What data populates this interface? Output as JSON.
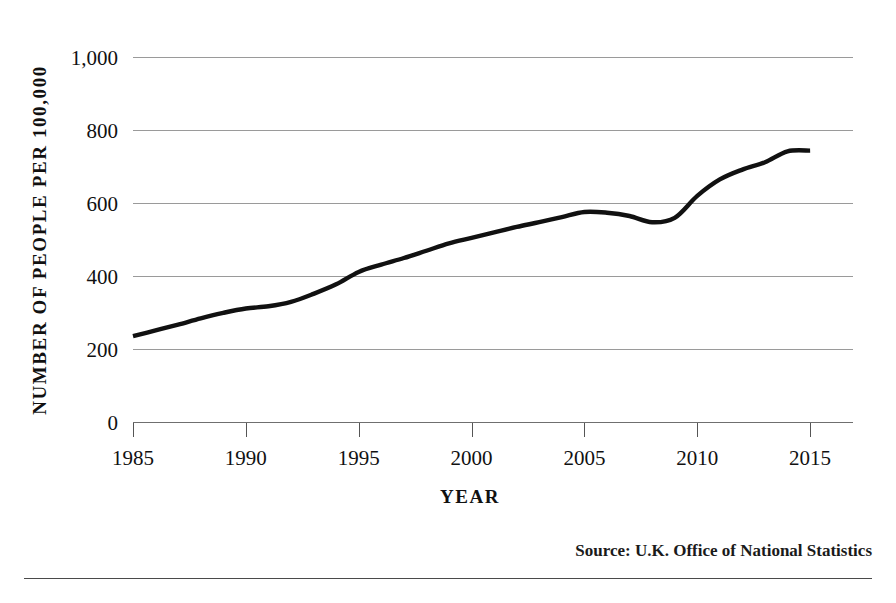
{
  "figure": {
    "background_color": "#ffffff",
    "line_color": "#111111",
    "grid_color": "#9a9a9a"
  },
  "source_note": "Source: U.K. Office of National Statistics",
  "chart_data": {
    "type": "line",
    "title": "",
    "xlabel": "YEAR",
    "ylabel": "NUMBER OF PEOPLE PER 100,000",
    "xlim": [
      1985,
      2016.9
    ],
    "ylim": [
      0,
      1000
    ],
    "grid": true,
    "legend": "none",
    "xticks": [
      1985,
      1990,
      1995,
      2000,
      2005,
      2010,
      2015
    ],
    "xtick_labels": [
      "1985",
      "1990",
      "1995",
      "2000",
      "2005",
      "2010",
      "2015"
    ],
    "yticks": [
      0,
      200,
      400,
      600,
      800,
      1000
    ],
    "ytick_labels": [
      "0",
      "200",
      "400",
      "600",
      "800",
      "1,000"
    ],
    "series": [
      {
        "name": "Prison population rate",
        "x": [
          1985,
          1986,
          1987,
          1988,
          1989,
          1990,
          1991,
          1992,
          1993,
          1994,
          1995,
          1996,
          1997,
          1998,
          1999,
          2000,
          2001,
          2002,
          2003,
          2004,
          2005,
          2006,
          2007,
          2008,
          2009,
          2010,
          2011,
          2012,
          2013,
          2014,
          2015
        ],
        "values": [
          236,
          252,
          268,
          285,
          300,
          312,
          318,
          330,
          352,
          378,
          412,
          432,
          450,
          470,
          490,
          505,
          520,
          535,
          548,
          562,
          576,
          574,
          565,
          548,
          560,
          620,
          665,
          692,
          712,
          742,
          744
        ]
      }
    ]
  }
}
